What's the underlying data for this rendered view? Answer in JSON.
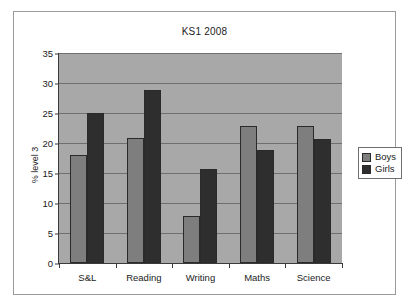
{
  "chart_data": {
    "type": "bar",
    "title": "KS1 2008",
    "xlabel": "",
    "ylabel": "% level 3",
    "categories": [
      "S&L",
      "Reading",
      "Writing",
      "Maths",
      "Science"
    ],
    "series": [
      {
        "name": "Boys",
        "color": "#7e7e7e",
        "values": [
          18.0,
          20.9,
          7.9,
          22.8,
          22.8
        ]
      },
      {
        "name": "Girls",
        "color": "#2e2e2e",
        "values": [
          25.0,
          28.9,
          15.7,
          18.9,
          20.7
        ]
      }
    ],
    "ylim": [
      0,
      35
    ],
    "ytick_step": 5,
    "yticks": [
      0,
      5,
      10,
      15,
      20,
      25,
      30,
      35
    ],
    "ytick_labels": [
      "0",
      "5",
      "10",
      "15",
      "20",
      "25",
      "30",
      "35"
    ],
    "grid": true,
    "grid_axis": "y",
    "legend_position": "right",
    "plot_background": "#a8a8a8",
    "figure_background": "#ffffff",
    "border_color": "#9a9a9a"
  },
  "legend": {
    "entries": [
      {
        "label": "Boys"
      },
      {
        "label": "Girls"
      }
    ]
  }
}
